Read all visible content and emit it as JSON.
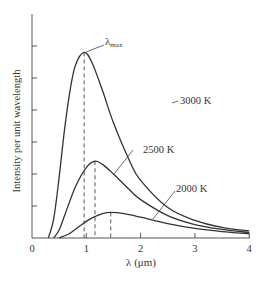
{
  "chart_data": {
    "type": "line",
    "title": "",
    "xlabel": "λ (μm)",
    "ylabel": "Intensity per unit wavelength",
    "xlim": [
      0,
      4
    ],
    "ylim": [
      0,
      6.5
    ],
    "x_ticks": [
      "0",
      "1",
      "2",
      "3",
      "4"
    ],
    "y_ticks_count": 6,
    "y_tick_labels": [],
    "grid": false,
    "legend": "none (curves labeled inline)",
    "annotations": [
      "λmax",
      "3000 K",
      "2500 K",
      "2000 K"
    ],
    "peak_marker": "dashed vertical lines from each curve peak to x-axis",
    "series": [
      {
        "name": "3000 K",
        "peak_lambda": 0.96,
        "peak_intensity": 5.8,
        "points": [
          [
            0.3,
            0.0
          ],
          [
            0.4,
            0.6
          ],
          [
            0.5,
            1.9
          ],
          [
            0.6,
            3.4
          ],
          [
            0.7,
            4.6
          ],
          [
            0.8,
            5.4
          ],
          [
            0.96,
            5.8
          ],
          [
            1.1,
            5.5
          ],
          [
            1.3,
            4.6
          ],
          [
            1.5,
            3.6
          ],
          [
            1.8,
            2.4
          ],
          [
            2.0,
            1.8
          ],
          [
            2.5,
            0.95
          ],
          [
            3.0,
            0.55
          ],
          [
            3.5,
            0.33
          ],
          [
            4.0,
            0.22
          ]
        ]
      },
      {
        "name": "2500 K",
        "peak_lambda": 1.16,
        "peak_intensity": 2.4,
        "points": [
          [
            0.4,
            0.0
          ],
          [
            0.5,
            0.25
          ],
          [
            0.6,
            0.7
          ],
          [
            0.8,
            1.6
          ],
          [
            1.0,
            2.2
          ],
          [
            1.16,
            2.4
          ],
          [
            1.3,
            2.3
          ],
          [
            1.5,
            2.0
          ],
          [
            1.8,
            1.5
          ],
          [
            2.0,
            1.2
          ],
          [
            2.5,
            0.7
          ],
          [
            3.0,
            0.42
          ],
          [
            3.5,
            0.27
          ],
          [
            4.0,
            0.17
          ]
        ]
      },
      {
        "name": "2000 K",
        "peak_lambda": 1.45,
        "peak_intensity": 0.8,
        "points": [
          [
            0.5,
            0.0
          ],
          [
            0.7,
            0.15
          ],
          [
            0.9,
            0.4
          ],
          [
            1.1,
            0.62
          ],
          [
            1.3,
            0.76
          ],
          [
            1.45,
            0.8
          ],
          [
            1.7,
            0.76
          ],
          [
            2.0,
            0.65
          ],
          [
            2.5,
            0.45
          ],
          [
            3.0,
            0.3
          ],
          [
            3.5,
            0.2
          ],
          [
            4.0,
            0.13
          ]
        ]
      }
    ]
  },
  "labels": {
    "lambda_max": "λ",
    "lambda_max_sub": "max",
    "t3000": "3000 K",
    "t2500": "2500 K",
    "t2000": "2000 K",
    "xlabel": "λ (μm)",
    "ylabel": "Intensity per unit wavelength",
    "x_ticks": [
      "0",
      "1",
      "2",
      "3",
      "4"
    ]
  }
}
